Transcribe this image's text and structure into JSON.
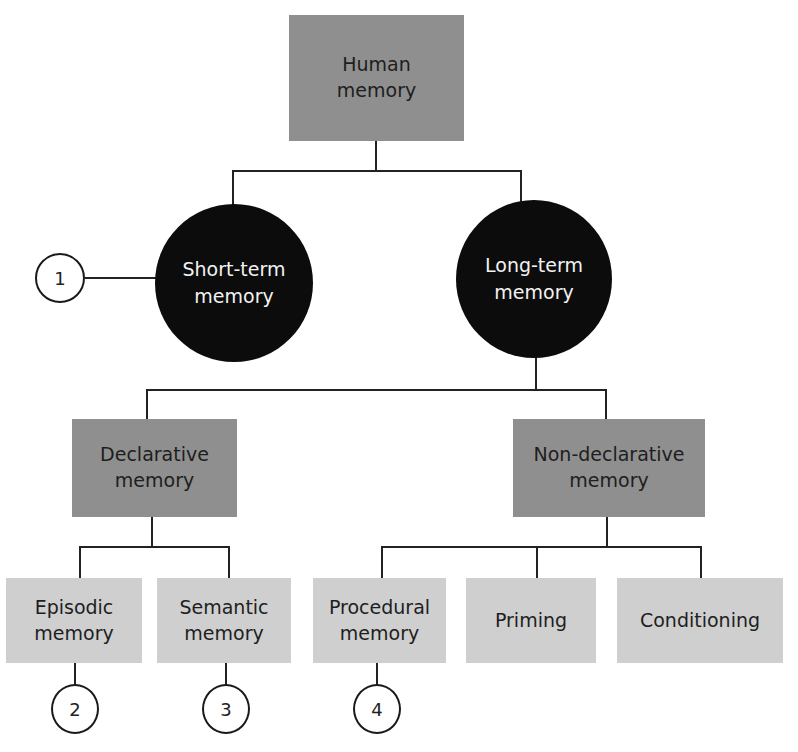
{
  "diagram": {
    "root": {
      "label": "Human\nmemory"
    },
    "level1": [
      {
        "label": "Short-term\nmemory",
        "marker": "1"
      },
      {
        "label": "Long-term\nmemory"
      }
    ],
    "level2": [
      {
        "label": "Declarative\nmemory"
      },
      {
        "label": "Non-declarative\nmemory"
      }
    ],
    "level3": [
      {
        "label": "Episodic\nmemory",
        "parent": "Declarative memory",
        "marker": "2"
      },
      {
        "label": "Semantic\nmemory",
        "parent": "Declarative memory",
        "marker": "3"
      },
      {
        "label": "Procedural\nmemory",
        "parent": "Non-declarative memory",
        "marker": "4"
      },
      {
        "label": "Priming",
        "parent": "Non-declarative memory"
      },
      {
        "label": "Conditioning",
        "parent": "Non-declarative memory"
      }
    ],
    "colors": {
      "root_and_level2_fill": "#8f8f8f",
      "level1_circle_fill": "#0c0c0c",
      "level3_fill": "#cfcfcf",
      "connector": "#222222"
    }
  }
}
